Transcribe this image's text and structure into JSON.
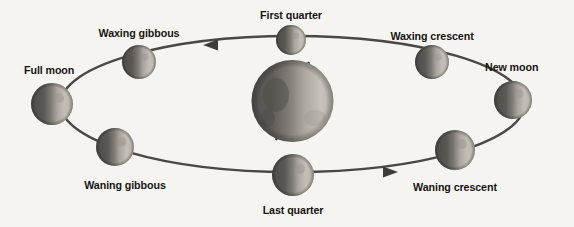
{
  "figure": {
    "background_color": "#f6f4f1",
    "ink_color": "#171513",
    "orbit_color": "#4a4744"
  },
  "center_body": {
    "name": "earth",
    "cx": 292.5,
    "cy": 101,
    "r": 41,
    "axis_tilt_deg": 23.5,
    "lit_side": "right"
  },
  "orbit": {
    "cx": 292.5,
    "cy": 104,
    "rx": 232,
    "ry": 68,
    "direction": "counterclockwise",
    "stroke_width": 2.4
  },
  "arrows": [
    {
      "name": "orbit-arrow-top",
      "x": 211,
      "y": 45,
      "points": "left"
    },
    {
      "name": "orbit-arrow-bottom",
      "x": 390,
      "y": 172,
      "points": "right"
    }
  ],
  "moons": [
    {
      "id": "new-moon",
      "label": "New moon",
      "cx": 513,
      "cy": 100,
      "r": 19,
      "lit_side": "right",
      "label_x": 485,
      "label_y": 62,
      "label_align": "left"
    },
    {
      "id": "waxing-crescent",
      "label": "Waxing crescent",
      "cx": 432,
      "cy": 62,
      "r": 17,
      "lit_side": "right",
      "label_x": 432,
      "label_y": 31,
      "label_align": "center"
    },
    {
      "id": "first-quarter",
      "label": "First quarter",
      "cx": 291,
      "cy": 40,
      "r": 15,
      "lit_side": "right",
      "label_x": 291,
      "label_y": 10,
      "label_align": "center"
    },
    {
      "id": "waxing-gibbous",
      "label": "Waxing gibbous",
      "cx": 139,
      "cy": 62,
      "r": 17,
      "lit_side": "right",
      "label_x": 139,
      "label_y": 28,
      "label_align": "center"
    },
    {
      "id": "full-moon",
      "label": "Full moon",
      "cx": 52,
      "cy": 104,
      "r": 21,
      "lit_side": "right",
      "label_x": 24,
      "label_y": 65,
      "label_align": "left"
    },
    {
      "id": "waning-gibbous",
      "label": "Waning gibbous",
      "cx": 115,
      "cy": 147,
      "r": 19,
      "lit_side": "right",
      "label_x": 125,
      "label_y": 180,
      "label_align": "center"
    },
    {
      "id": "last-quarter",
      "label": "Last quarter",
      "cx": 293,
      "cy": 175,
      "r": 21,
      "lit_side": "right",
      "label_x": 293,
      "label_y": 205,
      "label_align": "center"
    },
    {
      "id": "waning-crescent",
      "label": "Waning crescent",
      "cx": 455,
      "cy": 150,
      "r": 20,
      "lit_side": "right",
      "label_x": 455,
      "label_y": 182,
      "label_align": "center"
    }
  ]
}
